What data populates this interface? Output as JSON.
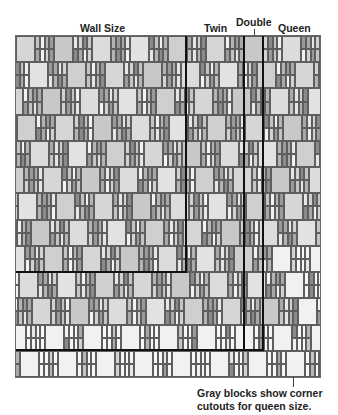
{
  "diagram": {
    "title_labels": [
      {
        "text": "Wall Size",
        "x": 80,
        "y": 22
      },
      {
        "text": "Twin",
        "x": 204,
        "y": 22
      },
      {
        "text": "Double",
        "x": 236,
        "y": 16
      },
      {
        "text": "Queen",
        "x": 278,
        "y": 22
      }
    ],
    "caption": {
      "line1": "Gray blocks show corner",
      "line2": "cutouts for queen size."
    },
    "quilt": {
      "x": 16,
      "y": 36,
      "width": 304,
      "height": 341,
      "rows": 13,
      "row_height": 26.23,
      "period": 38,
      "square_width": 19,
      "strip_count": 4,
      "row_shift": 13,
      "light_rows_from": 11
    },
    "size_outlines": [
      {
        "name": "Wall Size",
        "right": 186,
        "bottom": 272
      },
      {
        "name": "Twin",
        "right": 244,
        "bottom": 350
      },
      {
        "name": "Double",
        "right": 263,
        "bottom": 350
      },
      {
        "name": "Queen",
        "right": 320,
        "bottom": 377
      }
    ],
    "colors": {
      "square_tones": [
        "#cfcfcf",
        "#d6d6d6",
        "#c8c8c8",
        "#dcdcdc",
        "#e2e2e2"
      ],
      "strip_tones": [
        "#9a9a9a",
        "#b4b4b4",
        "#f2f2f2",
        "#c4c4c4",
        "#8a8a8a",
        "#d2d2d2",
        "#e6e6e6",
        "#a8a8a8"
      ],
      "light_square": "#f1f1f1",
      "light_strip": "#f7f7f7",
      "bold_line": "#111111"
    }
  }
}
